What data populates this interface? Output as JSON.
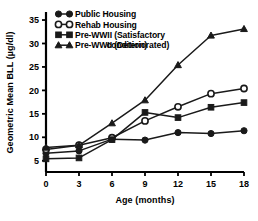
{
  "chart_data": {
    "type": "line",
    "title": "",
    "xlabel": "Age (months)",
    "ylabel": "Geometric Mean BLL (µg/dl)",
    "x": [
      0,
      3,
      6,
      9,
      12,
      15,
      18
    ],
    "xtick_labels": [
      "0",
      "3",
      "6",
      "9",
      "12",
      "15",
      "18"
    ],
    "ytick_labels": [
      "5",
      "10",
      "15",
      "20",
      "25",
      "30",
      "35"
    ],
    "ytick_values": [
      5,
      10,
      15,
      20,
      25,
      30,
      35
    ],
    "xlim": [
      0,
      18
    ],
    "ylim": [
      2.6,
      36.5
    ],
    "grid": false,
    "legend_position": "top-left",
    "series": [
      {
        "name": "Public Housing",
        "marker": "filled-circle",
        "values": [
          6.6,
          7.1,
          9.6,
          9.4,
          11.0,
          10.8,
          11.4
        ]
      },
      {
        "name": "Rehab Housing",
        "marker": "open-circle",
        "values": [
          7.4,
          8.3,
          9.9,
          13.5,
          16.5,
          19.3,
          20.4
        ]
      },
      {
        "name": "Pre-WWII (Satisfactory condition)",
        "marker": "filled-square",
        "values": [
          5.4,
          5.6,
          9.5,
          15.3,
          14.2,
          16.4,
          17.4
        ]
      },
      {
        "name": "Pre-WWII (Deteriorated)",
        "marker": "filled-triangle",
        "values": [
          7.8,
          8.3,
          13.0,
          17.9,
          25.4,
          31.7,
          33.1
        ]
      }
    ],
    "colors": {
      "line": "#1a1a1a",
      "axis": "#000000",
      "background": "#ffffff"
    }
  },
  "legend": {
    "entries": [
      {
        "label": "Public Housing",
        "marker": "filled-circle"
      },
      {
        "label": "Rehab Housing",
        "marker": "open-circle"
      },
      {
        "label": "Pre-WWII (Satisfactory",
        "label2": "condition)",
        "marker": "filled-square"
      },
      {
        "label": "Pre-WWII (Deteriorated)",
        "marker": "filled-triangle"
      }
    ]
  }
}
